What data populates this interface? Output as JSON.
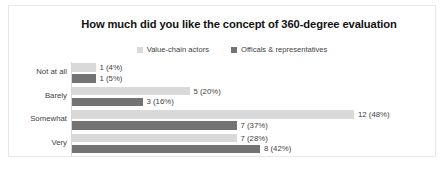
{
  "chart": {
    "title": "How much did you like the concept of 360-degree evaluation",
    "legend": [
      {
        "label": "Value-chain actors",
        "color": "#d9d9d9"
      },
      {
        "label": "Officals & representatives",
        "color": "#737373"
      }
    ]
  },
  "chart_data": {
    "type": "bar",
    "orientation": "horizontal",
    "title": "How much did you like the concept of 360-degree evaluation",
    "xlabel": "",
    "ylabel": "",
    "categories": [
      "Not at all",
      "Barely",
      "Somewhat",
      "Very"
    ],
    "xlim": [
      0,
      12
    ],
    "grid": false,
    "legend_position": "top-center",
    "series": [
      {
        "name": "Value-chain actors",
        "color": "#d9d9d9",
        "values": [
          1,
          5,
          12,
          7
        ],
        "percents": [
          "4%",
          "20%",
          "48%",
          "28%"
        ],
        "labels": [
          "1 (4%)",
          "5 (20%)",
          "12 (48%)",
          "7 (28%)"
        ]
      },
      {
        "name": "Officals & representatives",
        "color": "#737373",
        "values": [
          1,
          3,
          7,
          8
        ],
        "percents": [
          "5%",
          "16%",
          "37%",
          "42%"
        ],
        "labels": [
          "1 (5%)",
          "3 (16%)",
          "7 (37%)",
          "8 (42%)"
        ]
      }
    ]
  }
}
